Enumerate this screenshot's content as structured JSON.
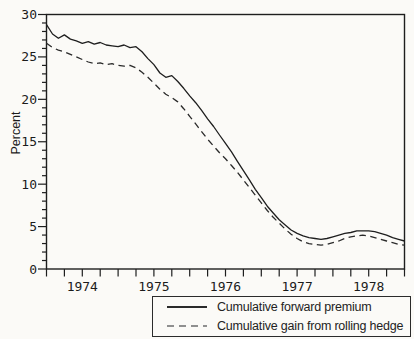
{
  "figure": {
    "ylabel": "Percent",
    "legend": {
      "items": [
        {
          "label": "Cumulative forward premium",
          "line_style": "solid"
        },
        {
          "label": "Cumulative gain from rolling hedge",
          "line_style": "dashed"
        }
      ]
    }
  },
  "colors": {
    "background": "#fbfaf7",
    "ink": "#1e1e1e",
    "solid_line": "#1e1e1e",
    "dashed_line": "#2a2a2a",
    "legend_dash_sample": "#8f8f8f",
    "legend_solid_sample": "#2a2a2a"
  },
  "chart_data": {
    "type": "line",
    "title": "",
    "xlabel": "",
    "ylabel": "Percent",
    "xlim": [
      1973.5,
      1978.5
    ],
    "ylim": [
      0,
      30
    ],
    "grid": false,
    "legend_position": "bottom-right-box",
    "x_tick_interval": 0.25,
    "x_major_ticks": [
      1974,
      1975,
      1976,
      1977,
      1978
    ],
    "x_tick_labels": [
      "1974",
      "1975",
      "1976",
      "1977",
      "1978"
    ],
    "y_major_ticks": [
      0,
      5,
      10,
      15,
      20,
      25,
      30
    ],
    "y_tick_labels": [
      "0",
      "5",
      "10",
      "15",
      "20",
      "25",
      "30"
    ],
    "y_minor_interval": 1,
    "x_start": 1973.5,
    "x_step": 0.0833333,
    "series": [
      {
        "name": "Cumulative forward premium",
        "line_style": "solid",
        "color": "#1e1e1e",
        "values": [
          28.8,
          27.7,
          27.2,
          27.6,
          27.1,
          26.9,
          26.6,
          26.8,
          26.5,
          26.7,
          26.4,
          26.3,
          26.2,
          26.4,
          26.1,
          26.2,
          25.6,
          24.8,
          24.1,
          23.1,
          22.6,
          22.8,
          22.1,
          21.3,
          20.4,
          19.6,
          18.7,
          17.7,
          16.8,
          15.8,
          14.8,
          13.8,
          12.7,
          11.6,
          10.5,
          9.4,
          8.4,
          7.4,
          6.6,
          5.8,
          5.2,
          4.6,
          4.2,
          3.9,
          3.7,
          3.6,
          3.5,
          3.6,
          3.8,
          4.0,
          4.2,
          4.3,
          4.5,
          4.5,
          4.5,
          4.4,
          4.2,
          4.0,
          3.7,
          3.5,
          3.3
        ]
      },
      {
        "name": "Cumulative gain from rolling hedge",
        "line_style": "dashed",
        "color": "#2a2a2a",
        "values": [
          26.6,
          26.1,
          25.8,
          25.6,
          25.3,
          25.0,
          24.7,
          24.4,
          24.2,
          24.3,
          24.1,
          24.2,
          24.0,
          23.9,
          24.0,
          23.7,
          23.2,
          22.6,
          21.9,
          21.2,
          20.6,
          20.2,
          19.7,
          18.9,
          18.0,
          17.1,
          16.2,
          15.3,
          14.5,
          13.7,
          13.0,
          12.2,
          11.4,
          10.5,
          9.6,
          8.7,
          7.8,
          6.9,
          6.1,
          5.4,
          4.7,
          4.1,
          3.6,
          3.2,
          3.0,
          2.9,
          2.8,
          2.9,
          3.1,
          3.3,
          3.6,
          3.8,
          3.9,
          4.0,
          3.9,
          3.7,
          3.5,
          3.3,
          3.1,
          2.9,
          2.8
        ]
      }
    ]
  }
}
